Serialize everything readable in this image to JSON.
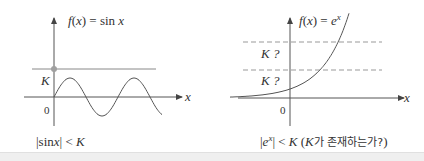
{
  "left_panel": {
    "function_label": "f(x) = sin x",
    "function_label_parts": {
      "f": "f",
      "open": "(",
      "x": "x",
      "close": ")",
      "eq": " = sin ",
      "var": "x"
    },
    "k_label": "K",
    "origin_label": "0",
    "x_axis_label": "x",
    "caption_parts": {
      "bar_open": "|",
      "sin": "sin",
      "x": "x",
      "bar_close": "|",
      "lt": " < ",
      "k": "K"
    },
    "colors": {
      "curve": "#555555",
      "bound_line": "#888888",
      "bound_point": "#999999",
      "axes": "#555555"
    }
  },
  "right_panel": {
    "function_label_parts": {
      "f": "f",
      "open": "(",
      "x": "x",
      "close": ")",
      "eq": " = ",
      "e": "e",
      "sup": "x"
    },
    "k_question_labels": [
      "K ?",
      "K ?"
    ],
    "origin_label": "0",
    "x_axis_label": "x",
    "caption_parts": {
      "bar_open": "|",
      "e": "e",
      "sup": "x",
      "bar_close": "|",
      "lt": " < ",
      "k": "K",
      "paren_open": " (",
      "k2": "K",
      "korean": "가 존재하는가?",
      "paren_close": ")"
    },
    "colors": {
      "curve": "#555555",
      "dashed_line": "#999999",
      "axes": "#555555"
    }
  }
}
